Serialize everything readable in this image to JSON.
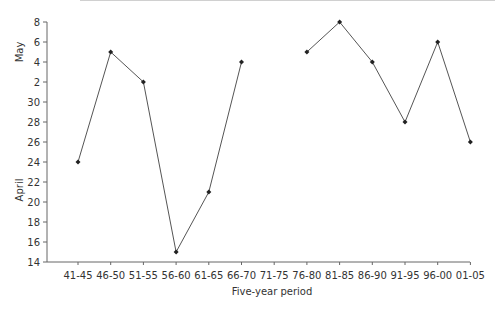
{
  "chart_data": {
    "type": "line",
    "title": "",
    "xlabel": "Five-year period",
    "ylabel_upper": "May",
    "ylabel_lower": "April",
    "categories": [
      "41-45",
      "46-50",
      "51-55",
      "56-60",
      "61-65",
      "66-70",
      "71-75",
      "76-80",
      "81-85",
      "86-90",
      "91-95",
      "96-00",
      "01-05"
    ],
    "y_tick_labels": [
      "8",
      "6",
      "4",
      "2",
      "30",
      "28",
      "26",
      "24",
      "22",
      "20",
      "18",
      "16",
      "14"
    ],
    "y_axis_note": "Date axis: top ticks are May days (8,6,4,2), then April days (30 down to 14)",
    "series": [
      {
        "name": "Date",
        "values": [
          "April 24",
          "May 5",
          "May 2",
          "April 15",
          "April 21",
          "May 4",
          null,
          "May 5",
          "May 8",
          "May 4",
          "April 28",
          "May 6",
          "April 26"
        ],
        "days_after_april_14": [
          10,
          21,
          18,
          1,
          7,
          20,
          null,
          21,
          24,
          20,
          14,
          22,
          12
        ]
      }
    ],
    "ylim_days_after_april_14": [
      0,
      24
    ],
    "grid": false,
    "legend": "none",
    "line_color": "#555555",
    "marker_color": "#222222"
  }
}
